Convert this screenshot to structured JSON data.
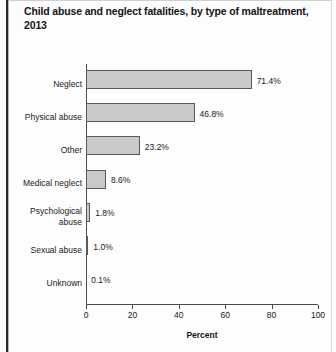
{
  "chart_data": {
    "type": "bar",
    "orientation": "horizontal",
    "title": "Child abuse and neglect fatalities, by type of maltreatment, 2013",
    "xlabel": "Percent",
    "ylabel": "",
    "xlim": [
      0,
      100
    ],
    "xticks": [
      0,
      20,
      40,
      60,
      80,
      100
    ],
    "xtick_labels": [
      "0",
      "20",
      "40",
      "60",
      "80",
      "100"
    ],
    "grid": false,
    "legend": false,
    "bar_fill_color": "#c9c9c9",
    "bar_edge_color": "#5a5a5a",
    "categories": [
      "Neglect",
      "Physical abuse",
      "Other",
      "Medical neglect",
      "Psychological\nabuse",
      "Sexual abuse",
      "Unknown"
    ],
    "values": [
      71.4,
      46.8,
      23.2,
      8.6,
      1.8,
      1.0,
      0.1
    ],
    "data_labels": [
      "71.4%",
      "46.8%",
      "23.2%",
      "8.6%",
      "1.8%",
      "1.0%",
      "0.1%"
    ]
  }
}
